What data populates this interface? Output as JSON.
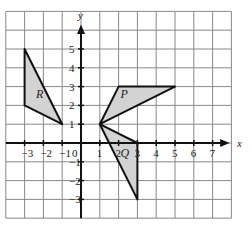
{
  "diagram": {
    "type": "coordinate-grid",
    "x_axis": {
      "label": "x",
      "min": -4,
      "max": 8,
      "tick_labels": [
        "−3",
        "−2",
        "−1",
        "0",
        "1",
        "2",
        "3",
        "4",
        "5",
        "6",
        "7"
      ]
    },
    "y_axis": {
      "label": "y",
      "min": -4,
      "max": 7,
      "tick_labels": [
        "5",
        "4",
        "3",
        "2",
        "1",
        "−1",
        "−2",
        "−3"
      ]
    },
    "shapes": [
      {
        "label": "R",
        "vertices": [
          [
            -3,
            5
          ],
          [
            -3,
            2
          ],
          [
            -1,
            1
          ]
        ],
        "fill": "#d3d3d3"
      },
      {
        "label": "P",
        "vertices": [
          [
            1,
            1
          ],
          [
            2,
            3
          ],
          [
            5,
            3
          ]
        ],
        "fill": "#d3d3d3"
      },
      {
        "label": "Q",
        "vertices": [
          [
            1,
            1
          ],
          [
            3,
            0
          ],
          [
            3,
            -3
          ]
        ],
        "fill": "#d3d3d3"
      }
    ],
    "colors": {
      "grid": "#888888",
      "axis": "#111111",
      "shape_stroke": "#111111",
      "shape_fill": "#d3d3d3"
    }
  }
}
